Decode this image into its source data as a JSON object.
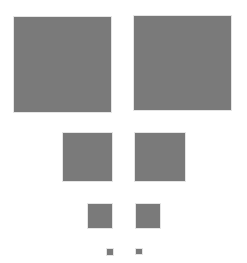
{
  "figure": {
    "color": "#7a7a7a",
    "background": "#ffffff",
    "squares": [
      {
        "id": "large-left",
        "x": 14,
        "y": 17,
        "w": 97,
        "h": 95
      },
      {
        "id": "large-right",
        "x": 134,
        "y": 16,
        "w": 97,
        "h": 94
      },
      {
        "id": "medium-left",
        "x": 63,
        "y": 133,
        "w": 49,
        "h": 48
      },
      {
        "id": "medium-right",
        "x": 135,
        "y": 133,
        "w": 50,
        "h": 48
      },
      {
        "id": "small-left",
        "x": 88,
        "y": 204,
        "w": 24,
        "h": 24
      },
      {
        "id": "small-right",
        "x": 136,
        "y": 204,
        "w": 24,
        "h": 24
      },
      {
        "id": "tiny-left",
        "x": 107,
        "y": 249,
        "w": 6,
        "h": 6
      },
      {
        "id": "tiny-right",
        "x": 136,
        "y": 249,
        "w": 6,
        "h": 5
      }
    ]
  }
}
